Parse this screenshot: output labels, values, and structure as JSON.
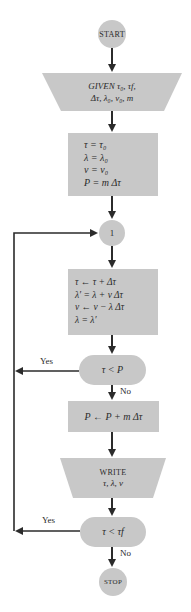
{
  "colors": {
    "node_fill": "#c8c8c8",
    "line": "#2b2b2b",
    "background": "#ffffff"
  },
  "nodes": {
    "start": {
      "label": "START",
      "shape": "circle"
    },
    "given": {
      "shape": "trapezoid",
      "line1": "GIVEN τ₀, τf,",
      "line2": "Δτ, λ₀, ν₀, m"
    },
    "init": {
      "shape": "rectangle",
      "lines": [
        "τ  =  τ₀",
        "λ  =  λ₀",
        "ν  =  ν₀",
        "P  =  m Δτ"
      ]
    },
    "connector": {
      "label": "1",
      "shape": "circle"
    },
    "update": {
      "shape": "rectangle",
      "lines": [
        "τ ← τ + Δτ",
        "λ′ = λ + ν Δτ",
        "ν ← ν − λ Δτ",
        "λ = λ′"
      ]
    },
    "decision1": {
      "shape": "rounded",
      "label": "τ < P"
    },
    "pupdate": {
      "shape": "rectangle",
      "label": "P ← P + m Δτ"
    },
    "write": {
      "shape": "trapezoid",
      "line1": "WRITE",
      "line2": "τ, λ, ν"
    },
    "decision2": {
      "shape": "rounded",
      "label": "τ < τf"
    },
    "stop": {
      "label": "STOP",
      "shape": "circle"
    }
  },
  "edges": {
    "decision1_yes": "Yes",
    "decision1_no": "No",
    "decision2_yes": "Yes",
    "decision2_no": "No"
  }
}
